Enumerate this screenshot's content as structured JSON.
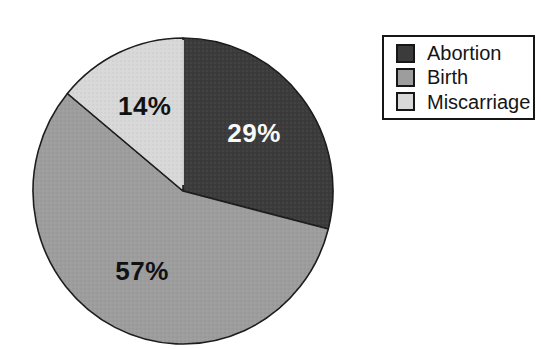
{
  "figure": {
    "background_color": "#ffffff"
  },
  "chart_data": {
    "type": "pie",
    "title": "",
    "categories": [
      "Abortion",
      "Birth",
      "Miscarriage"
    ],
    "values": [
      29,
      57,
      14
    ],
    "slices": [
      {
        "label": "Abortion",
        "value": 29,
        "display": "29%",
        "fill": "#3b3b3b",
        "text_color": "#fafafa"
      },
      {
        "label": "Birth",
        "value": 57,
        "display": "57%",
        "fill": "#9d9d9d",
        "text_color": "#111111"
      },
      {
        "label": "Miscarriage",
        "value": 14,
        "display": "14%",
        "fill": "#d8d8d8",
        "text_color": "#111111"
      }
    ],
    "start_angle_deg": 0,
    "direction": "clockwise",
    "outline_color": "#1c1c1c",
    "label_radius_frac": 0.6,
    "legend_position": "top-right",
    "legend_border_color": "#161616",
    "grid": false
  }
}
